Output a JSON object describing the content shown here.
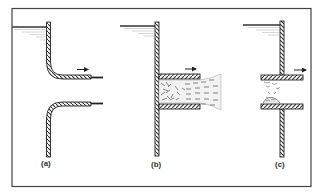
{
  "figure": {
    "colors": {
      "frame": "#444444",
      "wall": "#333333",
      "hatch": "#ffffff",
      "water": "#aaaaaa",
      "background": "#ffffff"
    },
    "panels": [
      {
        "id": "a",
        "label": "(a)",
        "type": "bell-mouth (rounded) entrance",
        "flow_arrow": "right"
      },
      {
        "id": "b",
        "label": "(b)",
        "type": "projecting square-edged pipe with jet contraction and turbulent mixing",
        "flow_arrow": "right"
      },
      {
        "id": "c",
        "label": "(c)",
        "type": "re-entrant (Borda) short tube with separation eddies",
        "flow_arrow": "right"
      }
    ]
  }
}
